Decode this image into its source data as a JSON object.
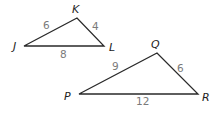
{
  "diagram": {
    "type": "similar-triangles",
    "triangles": [
      {
        "name": "triangle-JKL",
        "vertices": [
          {
            "label": "J",
            "x": 24,
            "y": 46,
            "lx": 13,
            "ly": 50
          },
          {
            "label": "K",
            "x": 77,
            "y": 18,
            "lx": 72,
            "ly": 13
          },
          {
            "label": "L",
            "x": 104,
            "y": 46,
            "lx": 109,
            "ly": 51
          }
        ],
        "sides": [
          {
            "between": "JK",
            "length": "6",
            "lx": 43,
            "ly": 29
          },
          {
            "between": "KL",
            "length": "4",
            "lx": 92,
            "ly": 30
          },
          {
            "between": "JL",
            "length": "8",
            "lx": 60,
            "ly": 58
          }
        ]
      },
      {
        "name": "triangle-PQR",
        "vertices": [
          {
            "label": "P",
            "x": 79,
            "y": 94,
            "lx": 64,
            "ly": 100
          },
          {
            "label": "Q",
            "x": 157,
            "y": 53,
            "lx": 151,
            "ly": 48
          },
          {
            "label": "R",
            "x": 198,
            "y": 94,
            "lx": 202,
            "ly": 101
          }
        ],
        "sides": [
          {
            "between": "PQ",
            "length": "9",
            "lx": 112,
            "ly": 70
          },
          {
            "between": "QR",
            "length": "6",
            "lx": 177,
            "ly": 72
          },
          {
            "between": "PR",
            "length": "12",
            "lx": 136,
            "ly": 105
          }
        ]
      }
    ]
  }
}
